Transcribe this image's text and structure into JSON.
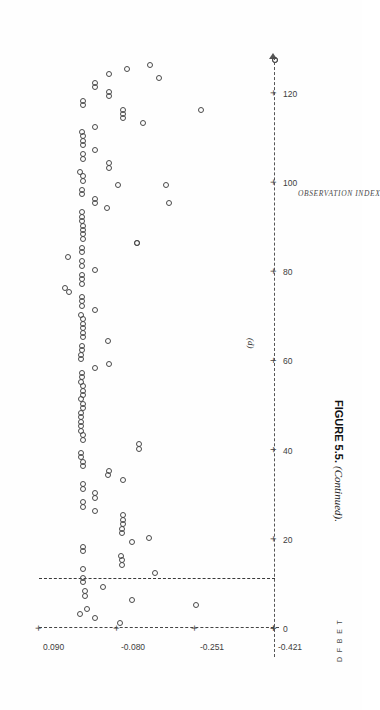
{
  "figure": {
    "caption_label": "FIGURE 5.5.",
    "caption_note": "(Continued).",
    "panel_letter": "(d)"
  },
  "chart_data": {
    "type": "scatter",
    "title": "",
    "xlabel": "OBSERVATION INDEX",
    "ylabel": "D F B E T",
    "orientation": "page-rotated-90",
    "grid": false,
    "legend": false,
    "xlim": [
      0,
      128
    ],
    "ylim": [
      -0.421,
      0.09
    ],
    "xticks": [
      0,
      20,
      40,
      60,
      80,
      100,
      120
    ],
    "xticklabels": [
      "0",
      "20",
      "40",
      "60",
      "80",
      "100",
      "120"
    ],
    "yticks": [
      0.09,
      -0.08,
      -0.251,
      -0.421
    ],
    "yticklabels": [
      "0.090",
      "-0.080",
      "-0.251",
      "-0.421"
    ],
    "reference_line_y": 0.0,
    "marker": "open-circle",
    "points": [
      [
        1,
        -0.085
      ],
      [
        2,
        -0.03
      ],
      [
        3,
        0.004
      ],
      [
        4,
        -0.012
      ],
      [
        5,
        -0.25
      ],
      [
        6,
        -0.11
      ],
      [
        7,
        -0.008
      ],
      [
        8,
        -0.008
      ],
      [
        9,
        -0.046
      ],
      [
        10,
        -0.004
      ],
      [
        11,
        -0.004
      ],
      [
        12,
        -0.16
      ],
      [
        13,
        -0.004
      ],
      [
        14,
        -0.088
      ],
      [
        15,
        -0.088
      ],
      [
        16,
        -0.086
      ],
      [
        17,
        -0.004
      ],
      [
        18,
        -0.004
      ],
      [
        19,
        -0.11
      ],
      [
        20,
        -0.146
      ],
      [
        21,
        -0.088
      ],
      [
        22,
        -0.088
      ],
      [
        23,
        -0.09
      ],
      [
        24,
        -0.09
      ],
      [
        25,
        -0.09
      ],
      [
        26,
        -0.03
      ],
      [
        27,
        -0.004
      ],
      [
        28,
        -0.004
      ],
      [
        29,
        -0.03
      ],
      [
        30,
        -0.03
      ],
      [
        31,
        -0.004
      ],
      [
        32,
        -0.004
      ],
      [
        33,
        -0.09
      ],
      [
        34,
        -0.058
      ],
      [
        35,
        -0.06
      ],
      [
        36,
        -0.004
      ],
      [
        37,
        -0.004
      ],
      [
        38,
        0.0
      ],
      [
        39,
        0.0
      ],
      [
        40,
        -0.126
      ],
      [
        41,
        -0.126
      ],
      [
        42,
        -0.004
      ],
      [
        43,
        -0.004
      ],
      [
        44,
        0.0
      ],
      [
        45,
        0.0
      ],
      [
        46,
        0.0
      ],
      [
        47,
        0.0
      ],
      [
        48,
        0.0
      ],
      [
        49,
        -0.004
      ],
      [
        50,
        -0.004
      ],
      [
        51,
        0.0
      ],
      [
        52,
        -0.004
      ],
      [
        53,
        -0.004
      ],
      [
        54,
        -0.004
      ],
      [
        55,
        0.0
      ],
      [
        56,
        -0.002
      ],
      [
        57,
        -0.002
      ],
      [
        58,
        -0.03
      ],
      [
        59,
        -0.06
      ],
      [
        60,
        0.0
      ],
      [
        61,
        0.0
      ],
      [
        62,
        -0.002
      ],
      [
        63,
        -0.002
      ],
      [
        64,
        -0.058
      ],
      [
        65,
        -0.004
      ],
      [
        66,
        -0.004
      ],
      [
        67,
        -0.004
      ],
      [
        68,
        -0.004
      ],
      [
        69,
        -0.004
      ],
      [
        70,
        0.0
      ],
      [
        71,
        -0.03
      ],
      [
        72,
        -0.002
      ],
      [
        73,
        -0.002
      ],
      [
        74,
        -0.002
      ],
      [
        75,
        0.028
      ],
      [
        76,
        0.036
      ],
      [
        77,
        -0.002
      ],
      [
        78,
        -0.002
      ],
      [
        79,
        -0.002
      ],
      [
        80,
        -0.03
      ],
      [
        81,
        -0.002
      ],
      [
        82,
        -0.002
      ],
      [
        83,
        0.03
      ],
      [
        84,
        -0.002
      ],
      [
        85,
        -0.002
      ],
      [
        86,
        -0.12
      ],
      [
        87,
        -0.004
      ],
      [
        88,
        -0.004
      ],
      [
        89,
        -0.004
      ],
      [
        90,
        -0.004
      ],
      [
        91,
        -0.002
      ],
      [
        92,
        -0.002
      ],
      [
        93,
        -0.002
      ],
      [
        94,
        -0.056
      ],
      [
        95,
        -0.03
      ],
      [
        96,
        -0.03
      ],
      [
        97,
        -0.002
      ],
      [
        98,
        -0.002
      ],
      [
        99,
        -0.08
      ],
      [
        100,
        -0.004
      ],
      [
        101,
        -0.004
      ],
      [
        102,
        0.004
      ],
      [
        103,
        -0.06
      ],
      [
        104,
        -0.06
      ],
      [
        105,
        -0.004
      ],
      [
        106,
        -0.004
      ],
      [
        107,
        -0.03
      ],
      [
        108,
        -0.004
      ],
      [
        109,
        -0.004
      ],
      [
        110,
        -0.004
      ],
      [
        111,
        -0.002
      ],
      [
        112,
        -0.03
      ],
      [
        113,
        -0.134
      ],
      [
        114,
        -0.09
      ],
      [
        115,
        -0.09
      ],
      [
        116,
        -0.09
      ],
      [
        117,
        -0.004
      ],
      [
        118,
        -0.004
      ],
      [
        119,
        -0.06
      ],
      [
        120,
        -0.06
      ],
      [
        121,
        -0.03
      ],
      [
        122,
        -0.03
      ],
      [
        123,
        -0.168
      ],
      [
        124,
        -0.06
      ],
      [
        125,
        -0.1
      ],
      [
        126,
        -0.15
      ],
      [
        127,
        -0.421
      ]
    ],
    "outliers": [
      [
        86,
        -0.12
      ],
      [
        95,
        -0.19
      ],
      [
        99,
        -0.185
      ],
      [
        116,
        -0.26
      ],
      [
        127,
        -0.421
      ]
    ]
  }
}
